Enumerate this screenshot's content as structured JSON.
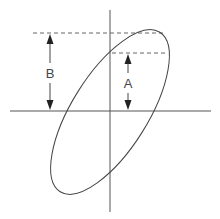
{
  "diagram": {
    "type": "hysteresis-ellipse",
    "labels": {
      "a": "A",
      "b": "B"
    },
    "colors": {
      "line": "#444444",
      "axis": "#555555",
      "background": "#ffffff"
    }
  }
}
